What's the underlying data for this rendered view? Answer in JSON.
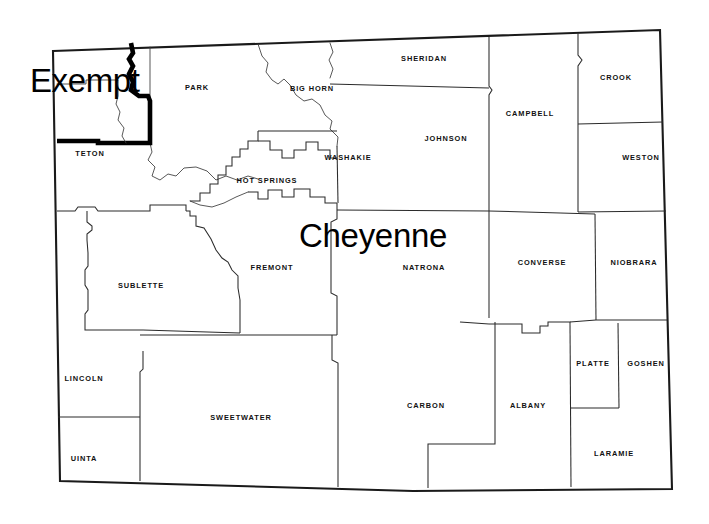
{
  "map": {
    "title": "Wyoming County Map",
    "state": "Wyoming",
    "background_color": "#ffffff",
    "line_color": "#2b2b2b",
    "border_color": "#1a1a1a",
    "exempt_outline_color": "#000000",
    "overlays": [
      {
        "id": "exempt",
        "text": "Exempt",
        "x": 30,
        "y": 64,
        "font_size": 33
      },
      {
        "id": "capital",
        "text": "Cheyenne",
        "x": 299,
        "y": 219,
        "font_size": 33
      }
    ],
    "counties": [
      {
        "name": "PARK",
        "label_x": 197,
        "label_y": 88
      },
      {
        "name": "BIG HORN",
        "label_x": 312,
        "label_y": 89
      },
      {
        "name": "SHERIDAN",
        "label_x": 424,
        "label_y": 59
      },
      {
        "name": "CROOK",
        "label_x": 616,
        "label_y": 78
      },
      {
        "name": "CAMPBELL",
        "label_x": 530,
        "label_y": 114
      },
      {
        "name": "JOHNSON",
        "label_x": 446,
        "label_y": 139
      },
      {
        "name": "WESTON",
        "label_x": 641,
        "label_y": 158
      },
      {
        "name": "TETON",
        "label_x": 90,
        "label_y": 154
      },
      {
        "name": "WASHAKIE",
        "label_x": 348,
        "label_y": 158
      },
      {
        "name": "HOT SPRINGS",
        "label_x": 267,
        "label_y": 181
      },
      {
        "name": "FREMONT",
        "label_x": 272,
        "label_y": 268
      },
      {
        "name": "NATRONA",
        "label_x": 424,
        "label_y": 268
      },
      {
        "name": "CONVERSE",
        "label_x": 542,
        "label_y": 263
      },
      {
        "name": "NIOBRARA",
        "label_x": 634,
        "label_y": 263
      },
      {
        "name": "SUBLETTE",
        "label_x": 141,
        "label_y": 286
      },
      {
        "name": "PLATTE",
        "label_x": 593,
        "label_y": 364
      },
      {
        "name": "GOSHEN",
        "label_x": 646,
        "label_y": 364
      },
      {
        "name": "LINCOLN",
        "label_x": 84,
        "label_y": 379
      },
      {
        "name": "SWEETWATER",
        "label_x": 241,
        "label_y": 418
      },
      {
        "name": "CARBON",
        "label_x": 426,
        "label_y": 406
      },
      {
        "name": "ALBANY",
        "label_x": 528,
        "label_y": 406
      },
      {
        "name": "LARAMIE",
        "label_x": 614,
        "label_y": 454
      },
      {
        "name": "UINTA",
        "label_x": 84,
        "label_y": 459
      }
    ]
  }
}
